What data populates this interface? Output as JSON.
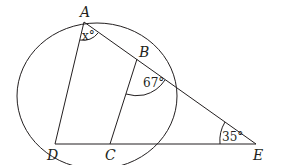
{
  "diagram": {
    "points": {
      "A": "A",
      "B": "B",
      "C": "C",
      "D": "D",
      "E": "E"
    },
    "angles": {
      "x": "x°",
      "b": "67°",
      "e": "35°"
    }
  }
}
